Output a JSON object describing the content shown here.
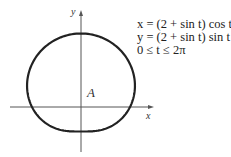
{
  "figure": {
    "x_axis_label": "x",
    "y_axis_label": "y",
    "region_label": "A",
    "equations": [
      "x = (2 + sin t) cos t",
      "y = (2 + sin t) sin t",
      "0 ≤ t ≤ 2π"
    ],
    "curve": {
      "type": "parametric",
      "x": "(2+sin t)cos t",
      "y": "(2+sin t)sin t",
      "t_range": [
        0,
        6.2832
      ]
    },
    "line_color": "#222222"
  }
}
